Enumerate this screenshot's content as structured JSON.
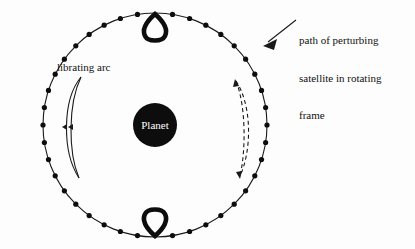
{
  "figure": {
    "background_color": "#fdfdfd",
    "ink_color": "#111111",
    "width": 415,
    "height": 249
  },
  "planet": {
    "label": "Planet",
    "fill_color": "#0d0d0d",
    "text_color": "#ffffff",
    "center_x": 155,
    "center_y": 125,
    "radius": 22
  },
  "orbit": {
    "name": "perturbing-satellite-path",
    "center_x": 155,
    "center_y": 125,
    "radius": 112,
    "line_color": "#1a1a1a",
    "dot_color": "#0d0d0d",
    "dot_radius": 2.6,
    "dot_count": 40,
    "loops": [
      {
        "name": "top-loop",
        "position": "top",
        "direction": "inward"
      },
      {
        "name": "bottom-loop",
        "position": "bottom",
        "direction": "inward"
      }
    ]
  },
  "annotations": {
    "path_label": {
      "line1": "path of perturbing",
      "line2": "satellite in rotating",
      "line3": "frame",
      "pointer": "arrow-to-orbit"
    },
    "librating_label": {
      "text": "librating arc"
    }
  },
  "librating_arc": {
    "name": "librating-arc-crescent",
    "style": "solid",
    "arrowheads": "double-left",
    "color": "#1a1a1a"
  },
  "dashed_arc": {
    "name": "dashed-libration-arc",
    "style": "dashed",
    "arrowheads": "both-ends",
    "color": "#1a1a1a"
  }
}
